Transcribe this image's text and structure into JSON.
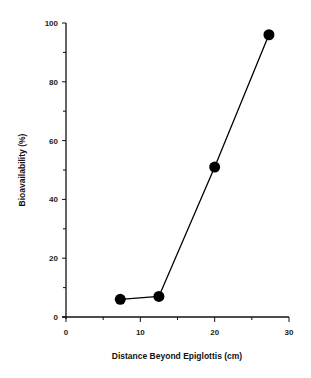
{
  "chart_data": {
    "type": "line",
    "title": "",
    "xlabel": "Distance Beyond Epiglottis (cm)",
    "ylabel": "Bioavailability (%)",
    "xlim": [
      0,
      30
    ],
    "ylim": [
      0,
      100
    ],
    "x_ticks": [
      0,
      10,
      20,
      30
    ],
    "y_ticks": [
      0,
      20,
      40,
      60,
      80,
      100
    ],
    "y_minor_ticks": [
      10,
      30,
      50,
      70,
      90
    ],
    "x_minor_ticks": [
      5,
      15,
      25
    ],
    "grid": false,
    "legend": null,
    "series": [
      {
        "name": "Bioavailability",
        "marker": "filled-circle",
        "color": "#000000",
        "x": [
          7.3,
          12.5,
          20.0,
          27.3
        ],
        "y": [
          6,
          7,
          51,
          96
        ]
      }
    ]
  },
  "labels": {
    "xlabel": "Distance Beyond Epiglottis (cm)",
    "ylabel": "Bioavailability (%)",
    "x_ticks": [
      "0",
      "10",
      "20",
      "30"
    ],
    "y_ticks": [
      "0",
      "20",
      "40",
      "60",
      "80",
      "100"
    ]
  }
}
